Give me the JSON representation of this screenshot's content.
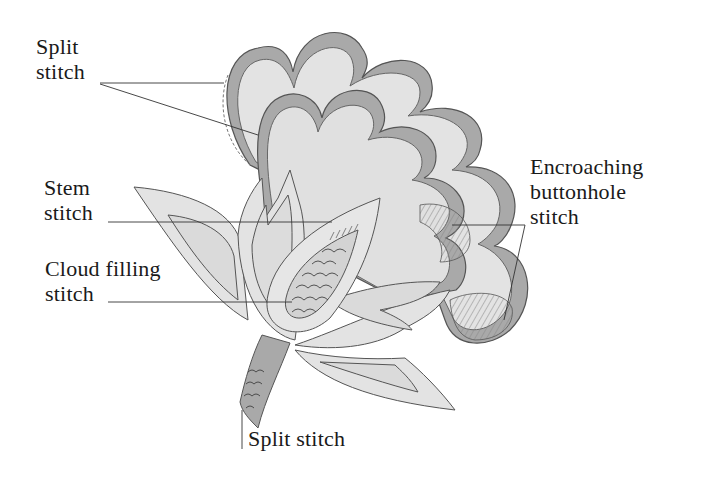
{
  "diagram": {
    "type": "embroidery-stitch-diagram",
    "colors": {
      "background": "#ffffff",
      "fill_light": "#e3e3e3",
      "fill_mid": "#d6d6d6",
      "band_dark": "#a9a9a9",
      "outline": "#555555",
      "leader_line": "#333333",
      "text": "#1a1a1a"
    },
    "labels": [
      {
        "id": "split-stitch-top",
        "lines": [
          "Split",
          "stitch"
        ]
      },
      {
        "id": "stem-stitch",
        "lines": [
          "Stem",
          "stitch"
        ]
      },
      {
        "id": "cloud-filling-stitch",
        "lines": [
          "Cloud filling",
          "stitch"
        ]
      },
      {
        "id": "encroaching-buttonhole-stitch",
        "lines": [
          "Encroaching",
          "buttonhole",
          "stitch"
        ]
      },
      {
        "id": "split-stitch-bottom",
        "lines": [
          "Split stitch"
        ]
      }
    ]
  }
}
